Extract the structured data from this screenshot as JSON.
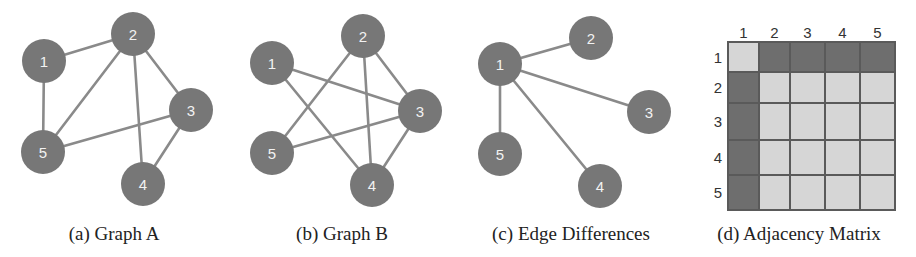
{
  "colors": {
    "node_fill": "#777777",
    "node_label": "#f2f2f2",
    "edge": "#8a8a8a",
    "matrix_dark": "#6e6e6e",
    "matrix_light": "#d6d6d6",
    "matrix_grid": "#5a5a5a",
    "caption": "#222222"
  },
  "panels": [
    {
      "id": "a",
      "caption": "(a) Graph A",
      "caption_x": 114,
      "nodes": [
        {
          "id": "1",
          "x": 44,
          "y": 61
        },
        {
          "id": "2",
          "x": 133,
          "y": 34
        },
        {
          "id": "3",
          "x": 191,
          "y": 110
        },
        {
          "id": "4",
          "x": 143,
          "y": 184
        },
        {
          "id": "5",
          "x": 43,
          "y": 152
        }
      ],
      "edges": [
        [
          "1",
          "2"
        ],
        [
          "1",
          "5"
        ],
        [
          "2",
          "5"
        ],
        [
          "2",
          "3"
        ],
        [
          "2",
          "4"
        ],
        [
          "3",
          "5"
        ],
        [
          "3",
          "4"
        ]
      ]
    },
    {
      "id": "b",
      "caption": "(b) Graph B",
      "caption_x": 342,
      "nodes": [
        {
          "id": "1",
          "x": 272,
          "y": 63
        },
        {
          "id": "2",
          "x": 363,
          "y": 36
        },
        {
          "id": "3",
          "x": 420,
          "y": 111
        },
        {
          "id": "4",
          "x": 372,
          "y": 185
        },
        {
          "id": "5",
          "x": 272,
          "y": 153
        }
      ],
      "edges": [
        [
          "1",
          "3"
        ],
        [
          "1",
          "4"
        ],
        [
          "2",
          "5"
        ],
        [
          "2",
          "3"
        ],
        [
          "2",
          "4"
        ],
        [
          "3",
          "5"
        ],
        [
          "3",
          "4"
        ]
      ]
    },
    {
      "id": "c",
      "caption": "(c) Edge Differences",
      "caption_x": 571,
      "nodes": [
        {
          "id": "1",
          "x": 500,
          "y": 64
        },
        {
          "id": "2",
          "x": 591,
          "y": 38
        },
        {
          "id": "3",
          "x": 649,
          "y": 112
        },
        {
          "id": "4",
          "x": 600,
          "y": 186
        },
        {
          "id": "5",
          "x": 500,
          "y": 154
        }
      ],
      "edges": [
        [
          "1",
          "2"
        ],
        [
          "1",
          "3"
        ],
        [
          "1",
          "4"
        ],
        [
          "1",
          "5"
        ]
      ]
    }
  ],
  "node_radius": 22,
  "matrix": {
    "caption": "(d) Adjacency Matrix",
    "caption_x": 799,
    "col_labels": [
      "1",
      "2",
      "3",
      "4",
      "5"
    ],
    "row_labels": [
      "1",
      "2",
      "3",
      "4",
      "5"
    ],
    "col_edges": [
      728,
      759,
      790,
      825,
      860,
      895
    ],
    "row_edges": [
      42,
      72,
      103,
      140,
      175,
      210
    ],
    "values": [
      [
        0,
        1,
        1,
        1,
        1
      ],
      [
        1,
        0,
        0,
        0,
        0
      ],
      [
        1,
        0,
        0,
        0,
        0
      ],
      [
        1,
        0,
        0,
        0,
        0
      ],
      [
        1,
        0,
        0,
        0,
        0
      ]
    ]
  },
  "caption_y": 240
}
